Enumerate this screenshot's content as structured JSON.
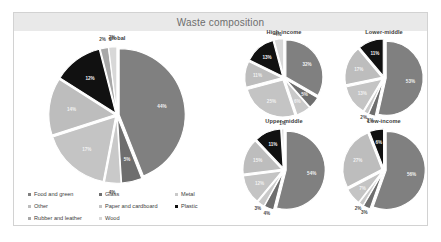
{
  "header": {
    "title": "Waste composition"
  },
  "colors": {
    "food_and_green": "#808080",
    "glass": "#6e6e6e",
    "metal": "#c9c9c9",
    "other": "#bdbdbd",
    "paper_and_cardboard": "#c4c4c4",
    "plastic": "#111111",
    "rubber_and_leather": "#a8a8a8",
    "wood": "#d8d8d8",
    "title_band": "#e9e9e9",
    "frame_border": "#d2d2d2",
    "background": "#ffffff"
  },
  "legend": {
    "columns": [
      {
        "items": [
          {
            "label": "Food and green",
            "color": "#808080"
          },
          {
            "label": "Other",
            "color": "#bdbdbd"
          },
          {
            "label": "Rubber and leather",
            "color": "#a8a8a8"
          }
        ]
      },
      {
        "items": [
          {
            "label": "Glass",
            "color": "#6e6e6e"
          },
          {
            "label": "Paper and cardboard",
            "color": "#c4c4c4"
          },
          {
            "label": "Wood",
            "color": "#d8d8d8"
          }
        ]
      },
      {
        "items": [
          {
            "label": "Metal",
            "color": "#c9c9c9"
          },
          {
            "label": "Plastic",
            "color": "#111111"
          }
        ]
      }
    ]
  },
  "chart_data": [
    {
      "type": "pie",
      "title": "global",
      "categories": [
        "Food and green",
        "Glass",
        "Metal",
        "Other",
        "Paper and cardboard",
        "Plastic",
        "Rubber and leather",
        "Wood"
      ],
      "values": [
        44,
        5,
        4,
        14,
        17,
        12,
        2,
        2
      ],
      "labels": [
        "44%",
        "5%",
        "4%",
        "14%",
        "17%",
        "12%",
        "2%",
        "2%"
      ],
      "colors": [
        "#808080",
        "#6e6e6e",
        "#c9c9c9",
        "#bdbdbd",
        "#c4c4c4",
        "#111111",
        "#a8a8a8",
        "#d8d8d8"
      ],
      "legend_position": "bottom-left",
      "grid": false
    },
    {
      "type": "pie",
      "title": "High-income",
      "categories": [
        "Food and green",
        "Glass",
        "Metal",
        "Other",
        "Paper and cardboard",
        "Plastic",
        "Wood"
      ],
      "values": [
        32,
        5,
        6,
        11,
        25,
        13,
        4
      ],
      "labels": [
        "32%",
        "5%",
        "6%",
        "11%",
        "25%",
        "13%",
        "4%"
      ],
      "colors": [
        "#808080",
        "#6e6e6e",
        "#c9c9c9",
        "#bdbdbd",
        "#c4c4c4",
        "#111111",
        "#d8d8d8"
      ],
      "legend_position": "shared",
      "grid": false
    },
    {
      "type": "pie",
      "title": "Lower-middle",
      "categories": [
        "Food and green",
        "Glass",
        "Metal",
        "Other",
        "Paper and cardboard",
        "Plastic"
      ],
      "values": [
        53,
        3,
        2,
        17,
        13,
        11
      ],
      "labels": [
        "53%",
        "3%",
        "2%",
        "17%",
        "13%",
        "11%"
      ],
      "colors": [
        "#808080",
        "#6e6e6e",
        "#c9c9c9",
        "#bdbdbd",
        "#c4c4c4",
        "#111111"
      ],
      "legend_position": "shared",
      "grid": false
    },
    {
      "type": "pie",
      "title": "Upper-middle",
      "categories": [
        "Food and green",
        "Glass",
        "Metal",
        "Other",
        "Paper and cardboard",
        "Plastic",
        "Wood"
      ],
      "values": [
        54,
        4,
        3,
        15,
        12,
        11,
        1
      ],
      "labels": [
        "54%",
        "4%",
        "3%",
        "15%",
        "12%",
        "11%",
        "1%"
      ],
      "colors": [
        "#808080",
        "#6e6e6e",
        "#c9c9c9",
        "#bdbdbd",
        "#c4c4c4",
        "#111111",
        "#d8d8d8"
      ],
      "legend_position": "shared",
      "grid": false
    },
    {
      "type": "pie",
      "title": "Low-income",
      "categories": [
        "Food and green",
        "Glass",
        "Metal",
        "Other",
        "Paper and cardboard",
        "Plastic"
      ],
      "values": [
        56,
        3,
        2,
        27,
        7,
        6
      ],
      "labels": [
        "56%",
        "3%",
        "2%",
        "27%",
        "7%",
        "6%"
      ],
      "colors": [
        "#808080",
        "#6e6e6e",
        "#c9c9c9",
        "#bdbdbd",
        "#c4c4c4",
        "#111111"
      ],
      "legend_position": "shared",
      "grid": false
    }
  ]
}
